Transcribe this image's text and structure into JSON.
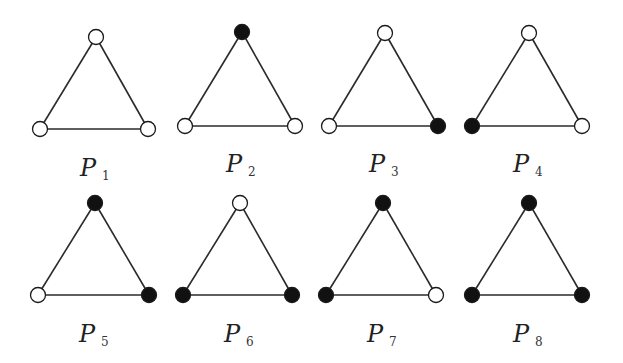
{
  "colors": {
    "black": "#111111",
    "white": "#ffffff",
    "edge": "#2a2a2a"
  },
  "legend": {
    "filled": "black vertex",
    "hollow": "white vertex"
  },
  "graphs": [
    {
      "name": "P",
      "sub": "1",
      "vertices": {
        "top": "white",
        "left": "white",
        "right": "white"
      }
    },
    {
      "name": "P",
      "sub": "2",
      "vertices": {
        "top": "black",
        "left": "white",
        "right": "white"
      }
    },
    {
      "name": "P",
      "sub": "3",
      "vertices": {
        "top": "white",
        "left": "white",
        "right": "black"
      }
    },
    {
      "name": "P",
      "sub": "4",
      "vertices": {
        "top": "white",
        "left": "black",
        "right": "white"
      }
    },
    {
      "name": "P",
      "sub": "5",
      "vertices": {
        "top": "black",
        "left": "white",
        "right": "black"
      }
    },
    {
      "name": "P",
      "sub": "6",
      "vertices": {
        "top": "white",
        "left": "black",
        "right": "black"
      }
    },
    {
      "name": "P",
      "sub": "7",
      "vertices": {
        "top": "black",
        "left": "black",
        "right": "white"
      }
    },
    {
      "name": "P",
      "sub": "8",
      "vertices": {
        "top": "black",
        "left": "black",
        "right": "black"
      }
    }
  ]
}
